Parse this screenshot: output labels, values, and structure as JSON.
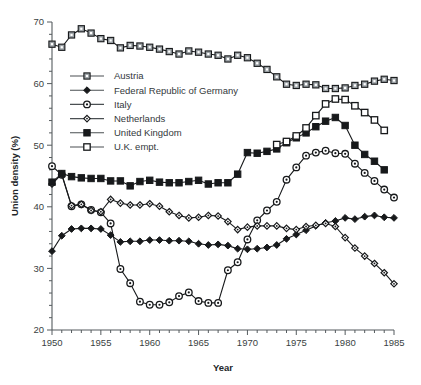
{
  "chart_data": {
    "type": "line",
    "title": "",
    "xlabel": "Year",
    "ylabel": "Union density (%)",
    "xlim": [
      1950,
      1985
    ],
    "ylim": [
      20,
      70
    ],
    "grid": false,
    "legend_position": "upper-left-inside",
    "x_ticks_major": [
      1950,
      1955,
      1960,
      1965,
      1970,
      1975,
      1980,
      1985
    ],
    "x_tick_labels": [
      "1950",
      "1955",
      "1960",
      "1965",
      "1970",
      "1975",
      "1980",
      "1985"
    ],
    "x_minor_step": 1,
    "y_ticks_major": [
      20,
      30,
      40,
      50,
      60,
      70
    ],
    "y_tick_labels": [
      "20",
      "30",
      "40",
      "50",
      "60",
      "70"
    ],
    "y_minor_step": 2,
    "series": [
      {
        "name": "Austria",
        "marker": "open-square-gray",
        "x": [
          1950,
          1951,
          1952,
          1953,
          1954,
          1955,
          1956,
          1957,
          1958,
          1959,
          1960,
          1961,
          1962,
          1963,
          1964,
          1965,
          1966,
          1967,
          1968,
          1969,
          1970,
          1971,
          1972,
          1973,
          1974,
          1975,
          1976,
          1977,
          1978,
          1979,
          1980,
          1981,
          1982,
          1983,
          1984,
          1985
        ],
        "values": [
          66.4,
          65.9,
          67.9,
          68.9,
          68.2,
          67.3,
          67.0,
          65.8,
          66.2,
          66.1,
          65.9,
          65.6,
          65.2,
          64.8,
          65.3,
          65.1,
          64.8,
          64.6,
          64.0,
          64.6,
          64.2,
          63.3,
          62.3,
          61.1,
          59.9,
          59.7,
          59.9,
          59.8,
          59.2,
          59.2,
          59.3,
          59.7,
          59.9,
          60.4,
          60.7,
          60.5
        ]
      },
      {
        "name": "Federal Republic of Germany",
        "marker": "filled-diamond",
        "x": [
          1950,
          1951,
          1952,
          1953,
          1954,
          1955,
          1956,
          1957,
          1958,
          1959,
          1960,
          1961,
          1962,
          1963,
          1964,
          1965,
          1966,
          1967,
          1968,
          1969,
          1970,
          1971,
          1972,
          1973,
          1974,
          1975,
          1976,
          1977,
          1978,
          1979,
          1980,
          1981,
          1982,
          1983,
          1984,
          1985
        ],
        "values": [
          32.8,
          35.3,
          36.4,
          36.5,
          36.5,
          36.4,
          35.4,
          34.3,
          34.4,
          34.4,
          34.6,
          34.6,
          34.5,
          34.5,
          34.4,
          34.0,
          33.8,
          33.9,
          33.7,
          33.2,
          33.1,
          33.2,
          33.4,
          33.8,
          34.8,
          35.5,
          36.2,
          36.9,
          37.4,
          37.7,
          38.2,
          38.0,
          38.4,
          38.6,
          38.3,
          38.2
        ]
      },
      {
        "name": "Italy",
        "marker": "open-circle",
        "x": [
          1950,
          1951,
          1952,
          1953,
          1954,
          1955,
          1956,
          1957,
          1958,
          1959,
          1960,
          1961,
          1962,
          1963,
          1964,
          1965,
          1966,
          1967,
          1968,
          1969,
          1970,
          1971,
          1972,
          1973,
          1974,
          1975,
          1976,
          1977,
          1978,
          1979,
          1980,
          1981,
          1982,
          1983,
          1984,
          1985
        ],
        "values": [
          46.6,
          45.2,
          40.1,
          40.4,
          39.5,
          39.1,
          37.3,
          29.9,
          27.6,
          24.6,
          24.1,
          24.1,
          24.5,
          25.5,
          26.1,
          24.7,
          24.4,
          24.4,
          29.7,
          31.0,
          34.7,
          37.8,
          39.4,
          40.8,
          44.4,
          46.4,
          48.3,
          48.8,
          49.1,
          48.7,
          48.6,
          47.0,
          45.5,
          44.2,
          42.8,
          41.5
        ]
      },
      {
        "name": "Netherlands",
        "marker": "small-open-diamond",
        "x": [
          1950,
          1951,
          1952,
          1953,
          1954,
          1955,
          1956,
          1957,
          1958,
          1959,
          1960,
          1961,
          1962,
          1963,
          1964,
          1965,
          1966,
          1967,
          1968,
          1969,
          1970,
          1971,
          1972,
          1973,
          1974,
          1975,
          1976,
          1977,
          1978,
          1979,
          1980,
          1981,
          1982,
          1983,
          1984,
          1985
        ],
        "values": [
          43.7,
          45.3,
          40.2,
          40.4,
          39.4,
          39.2,
          41.2,
          40.6,
          40.3,
          40.3,
          40.5,
          40.1,
          39.2,
          38.6,
          38.2,
          38.3,
          38.6,
          38.5,
          37.6,
          36.3,
          36.7,
          36.9,
          36.9,
          36.9,
          36.5,
          36.3,
          36.8,
          37.0,
          37.3,
          36.8,
          35.0,
          33.3,
          32.0,
          30.8,
          29.3,
          27.5
        ]
      },
      {
        "name": "United Kingdom",
        "marker": "filled-square",
        "x": [
          1950,
          1951,
          1952,
          1953,
          1954,
          1955,
          1956,
          1957,
          1958,
          1959,
          1960,
          1961,
          1962,
          1963,
          1964,
          1965,
          1966,
          1967,
          1968,
          1969,
          1970,
          1971,
          1972,
          1973,
          1974,
          1975,
          1976,
          1977,
          1978,
          1979,
          1980,
          1981,
          1982,
          1983,
          1984
        ],
        "values": [
          44.0,
          45.4,
          44.9,
          44.7,
          44.6,
          44.6,
          44.2,
          44.2,
          43.4,
          44.1,
          44.3,
          44.0,
          43.9,
          43.9,
          44.1,
          44.3,
          43.7,
          43.9,
          43.9,
          45.3,
          48.8,
          48.7,
          49.0,
          49.4,
          50.4,
          51.2,
          52.0,
          53.0,
          53.9,
          54.5,
          53.2,
          50.0,
          48.5,
          47.4,
          46.0
        ]
      },
      {
        "name": "U.K. empt.",
        "marker": "open-square",
        "x": [
          1973,
          1974,
          1975,
          1976,
          1977,
          1978,
          1979,
          1980,
          1981,
          1982,
          1983,
          1984
        ],
        "values": [
          50.1,
          50.6,
          51.5,
          52.8,
          54.8,
          56.7,
          57.5,
          57.4,
          56.4,
          55.3,
          54.1,
          52.4
        ]
      }
    ]
  },
  "legend": {
    "entries": [
      {
        "label": "Austria"
      },
      {
        "label": "Federal Republic of Germany"
      },
      {
        "label": "Italy"
      },
      {
        "label": "Netherlands"
      },
      {
        "label": "United Kingdom"
      },
      {
        "label": "U.K. empt."
      }
    ]
  },
  "colors": {
    "line": "#17191b",
    "axis": "#555b5e",
    "text": "#33383b",
    "austria_marker_fill": "#9aa0a4"
  }
}
